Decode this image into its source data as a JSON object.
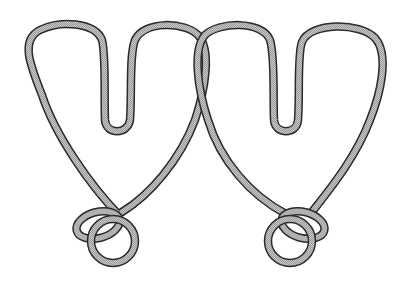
{
  "figure": {
    "background": "#ffffff",
    "wire_fill_color": "#bdbdbd",
    "wire_outline_color": "#2a2a2a",
    "components": [
      {
        "name": "left-wire-loop",
        "description": "Left W/heart-shaped wire loop"
      },
      {
        "name": "right-wire-loop",
        "description": "Right W/heart-shaped wire loop, interlocked with the left one at the top center"
      },
      {
        "name": "left-ring",
        "description": "Small ring knotted at the bottom of the left loop"
      },
      {
        "name": "right-ring",
        "description": "Small ring knotted at the bottom of the right loop"
      }
    ]
  }
}
